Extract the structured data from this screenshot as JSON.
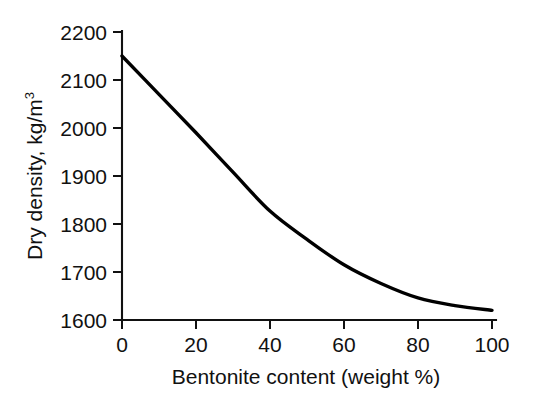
{
  "chart_data": {
    "type": "line",
    "title": "",
    "subtitle": "",
    "xlabel": "Bentonite content (weight %)",
    "ylabel": "Dry density, kg/m",
    "ylabel_superscript": "3",
    "ylabel_full": "Dry density, kg/m3",
    "x": [
      0,
      10,
      20,
      30,
      40,
      50,
      60,
      70,
      80,
      90,
      100
    ],
    "values": [
      2150,
      2070,
      1990,
      1908,
      1827,
      1768,
      1715,
      1676,
      1646,
      1630,
      1620
    ],
    "series": [
      {
        "name": "dry density",
        "color": "#000000",
        "values": [
          2150,
          2070,
          1990,
          1908,
          1827,
          1768,
          1715,
          1676,
          1646,
          1630,
          1620
        ]
      }
    ],
    "xlim": [
      0,
      100
    ],
    "ylim": [
      1600,
      2200
    ],
    "xticks": [
      0,
      20,
      40,
      60,
      80,
      100
    ],
    "yticks": [
      1600,
      1700,
      1800,
      1900,
      2000,
      2100,
      2200
    ],
    "xtick_labels": [
      "0",
      "20",
      "40",
      "60",
      "80",
      "100"
    ],
    "ytick_labels": [
      "1600",
      "1700",
      "1800",
      "1900",
      "2000",
      "2100",
      "2200"
    ],
    "grid": false,
    "legend": null,
    "legend_position": "none",
    "annotations": [],
    "background_color": "#ffffff",
    "axis_color": "#111111",
    "tick_direction": "out"
  },
  "axis": {
    "y_labels": {
      "t0": "1600",
      "t1": "1700",
      "t2": "1800",
      "t3": "1900",
      "t4": "2000",
      "t5": "2100",
      "t6": "2200"
    },
    "x_labels": {
      "t0": "0",
      "t1": "20",
      "t2": "40",
      "t3": "60",
      "t4": "80",
      "t5": "100"
    },
    "x_title": "Bentonite content (weight %)",
    "y_title_main": "Dry density, kg/m",
    "y_title_sup": "3"
  }
}
